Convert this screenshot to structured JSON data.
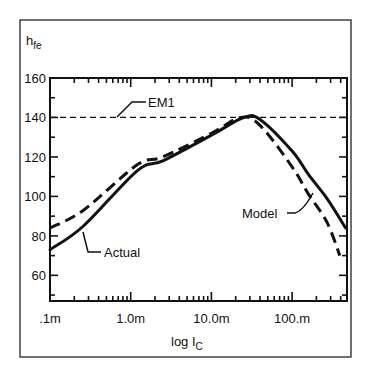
{
  "chart_data": {
    "type": "line",
    "title": "",
    "xlabel": "log I",
    "xlabel_sub": "C",
    "ylabel": "h",
    "ylabel_sub": "fe",
    "xscale": "log",
    "xlim": [
      0.0001,
      0.46
    ],
    "ylim": [
      47,
      160
    ],
    "x_ticks": [
      {
        "value": 0.0001,
        "label": ".1m"
      },
      {
        "value": 0.001,
        "label": "1.0m"
      },
      {
        "value": 0.01,
        "label": "10.0m"
      },
      {
        "value": 0.1,
        "label": "100.m"
      }
    ],
    "y_ticks": [
      {
        "value": 60,
        "label": "60"
      },
      {
        "value": 80,
        "label": "80"
      },
      {
        "value": 100,
        "label": "100"
      },
      {
        "value": 120,
        "label": "120"
      },
      {
        "value": 140,
        "label": "140"
      },
      {
        "value": 160,
        "label": "160"
      }
    ],
    "grid": false,
    "series": [
      {
        "name": "Actual",
        "style": "solid",
        "x": [
          0.0001,
          0.00026,
          0.0012,
          0.0025,
          0.01,
          0.025,
          0.04,
          0.1,
          0.16,
          0.27,
          0.46
        ],
        "y": [
          73,
          85,
          113,
          118,
          131,
          140,
          139,
          123,
          111,
          99,
          84
        ]
      },
      {
        "name": "Model",
        "style": "dashed",
        "x": [
          0.0001,
          0.00026,
          0.0012,
          0.0025,
          0.01,
          0.023,
          0.04,
          0.1,
          0.16,
          0.27,
          0.39
        ],
        "y": [
          84,
          93,
          116,
          120,
          132,
          140,
          136,
          115,
          101,
          87,
          70
        ]
      },
      {
        "name": "EM1",
        "style": "thin-dashed",
        "x": [
          0.0001,
          0.46
        ],
        "y": [
          140,
          140
        ]
      }
    ],
    "annotations": [
      {
        "text": "EM1",
        "target_series": "EM1"
      },
      {
        "text": "Actual",
        "target_series": "Actual"
      },
      {
        "text": "Model",
        "target_series": "Model"
      }
    ]
  },
  "labels": {
    "y_axis_main": "h",
    "y_axis_sub": "fe",
    "x_axis_main": "log I",
    "x_axis_sub": "C",
    "em1": "EM1",
    "actual": "Actual",
    "model": "Model"
  }
}
